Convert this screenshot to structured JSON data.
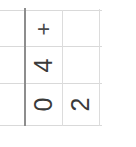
{
  "document": {
    "kind": "scanned-table-fragment",
    "orientation": "text rotated 90 degrees counter-clockwise",
    "background_color": "#ffffff",
    "rule_color": "#d9d9d9",
    "heavy_rule_color": "#8d8d8d",
    "text_color": "#3a3a3a"
  },
  "table": {
    "columns": [
      "col-1",
      "col-2",
      "col-3"
    ],
    "rows": [
      {
        "cells": [
          "",
          "+",
          ""
        ]
      },
      {
        "cells": [
          "",
          "4",
          ""
        ]
      },
      {
        "cells": [
          "",
          "0",
          "2"
        ]
      }
    ]
  },
  "cells": {
    "r1c2": "+",
    "r2c2": "4",
    "r3c2": "0",
    "r3c3": "2",
    "r1c1": "",
    "r2c1": "",
    "r3c1": "",
    "r1c3": "",
    "r2c3": ""
  }
}
